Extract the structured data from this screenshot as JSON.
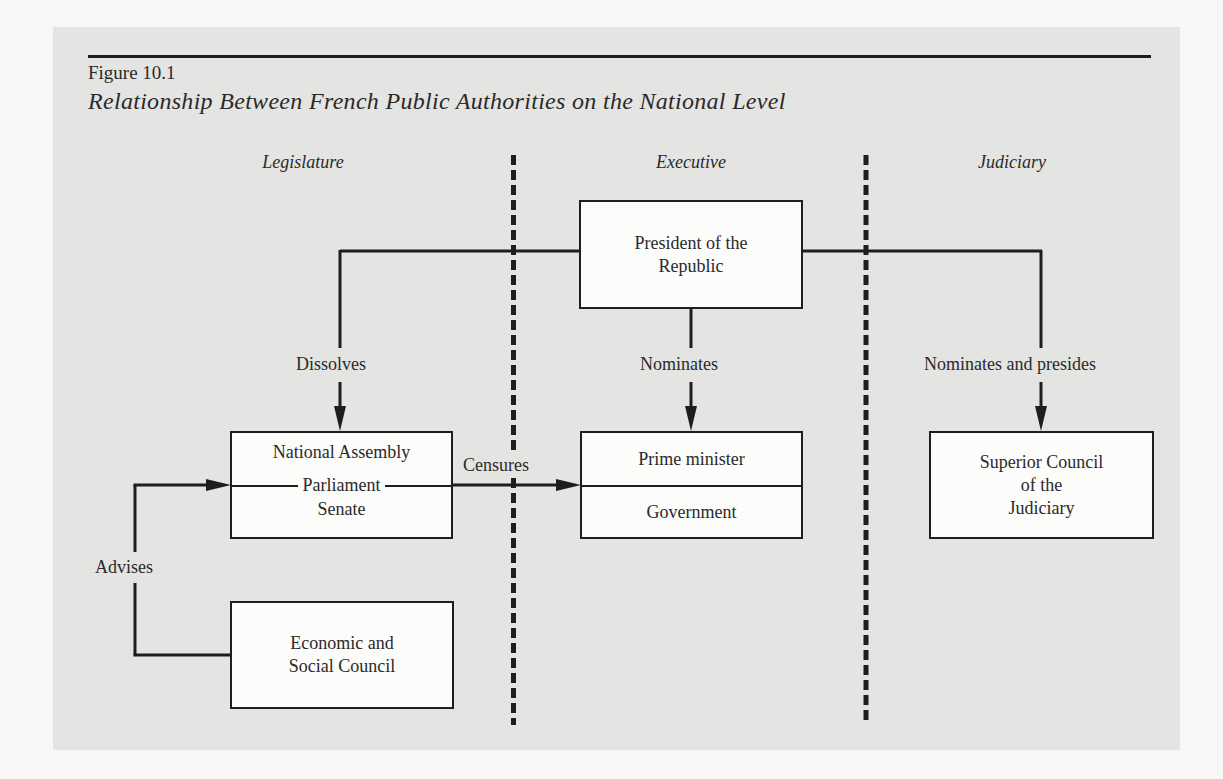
{
  "figure": {
    "number": "Figure 10.1",
    "title": "Relationship Between French Public Authorities on the National Level"
  },
  "columns": [
    {
      "label": "Legislature"
    },
    {
      "label": "Executive"
    },
    {
      "label": "Judiciary"
    }
  ],
  "nodes": {
    "president": {
      "line1": "President of the",
      "line2": "Republic"
    },
    "parliament": {
      "top": "National Assembly",
      "middle": "Parliament",
      "bottom": "Senate"
    },
    "prime_minister": {
      "top": "Prime minister",
      "bottom": "Government"
    },
    "superior_council": {
      "line1": "Superior Council",
      "line2": "of the",
      "line3": "Judiciary"
    },
    "economic_council": {
      "line1": "Economic and",
      "line2": "Social Council"
    }
  },
  "edges": {
    "dissolves": "Dissolves",
    "nominates": "Nominates",
    "nominates_presides": "Nominates and presides",
    "censures": "Censures",
    "advises": "Advises"
  },
  "colors": {
    "panel": "#e4e4e2",
    "ink": "#1e1e1e",
    "box_fill": "#fcfcfb"
  }
}
